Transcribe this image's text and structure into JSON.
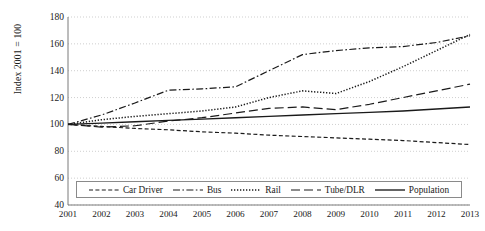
{
  "chart_data": {
    "type": "line",
    "title": "",
    "xlabel": "",
    "ylabel": "Index 2001 = 100",
    "x": [
      2001,
      2002,
      2003,
      2004,
      2005,
      2006,
      2007,
      2008,
      2009,
      2010,
      2011,
      2012,
      2013
    ],
    "xticklabels": [
      "2001",
      "2002",
      "2003",
      "2004",
      "2005",
      "2006",
      "2007",
      "2008",
      "2009",
      "2010",
      "2011",
      "2012",
      "2013"
    ],
    "yticklabels": [
      "180",
      "160",
      "140",
      "120",
      "100",
      "80",
      "60",
      "40"
    ],
    "yticks": [
      180,
      160,
      140,
      120,
      100,
      80,
      60,
      40
    ],
    "ylim": [
      40,
      180
    ],
    "xlim": [
      2001,
      2013
    ],
    "grid": "horizontal-dotted",
    "legend_position": "inside-bottom-center",
    "series": [
      {
        "name": "Car Driver",
        "style": "dashed",
        "color": "#1a1a1a",
        "values": [
          100,
          98.5,
          97,
          96,
          94.5,
          93.5,
          92,
          91,
          90,
          89,
          88,
          86.5,
          85
        ]
      },
      {
        "name": "Bus",
        "style": "dash-dot",
        "color": "#1a1a1a",
        "values": [
          100,
          107,
          116,
          125.5,
          126.5,
          128,
          140,
          152,
          155,
          157,
          158,
          161,
          166
        ]
      },
      {
        "name": "Rail",
        "style": "dotted",
        "color": "#1a1a1a",
        "values": [
          100,
          103.5,
          106,
          108,
          110,
          113,
          120,
          125,
          123,
          132,
          143,
          155,
          167
        ]
      },
      {
        "name": "Tube/DLR",
        "style": "long-dash",
        "color": "#1a1a1a",
        "values": [
          100,
          98,
          99,
          102.5,
          105,
          108.5,
          112,
          113,
          111,
          115,
          120,
          125,
          130
        ]
      },
      {
        "name": "Population",
        "style": "solid",
        "color": "#1a1a1a",
        "values": [
          100,
          101,
          102,
          103,
          104,
          105,
          106,
          107,
          108,
          109,
          110,
          111.5,
          113
        ]
      }
    ]
  },
  "legend": {
    "items": [
      {
        "label": "Car Driver",
        "style": "dashed"
      },
      {
        "label": "Bus",
        "style": "dash-dot"
      },
      {
        "label": "Rail",
        "style": "dotted"
      },
      {
        "label": "Tube/DLR",
        "style": "long-dash"
      },
      {
        "label": "Population",
        "style": "solid"
      }
    ]
  }
}
